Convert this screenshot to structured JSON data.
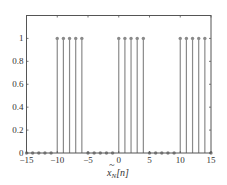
{
  "chart_data": {
    "type": "stem",
    "title": "",
    "xlabel": "x̃_N[n]",
    "xlabel_parts": {
      "base": "x",
      "tilde": "~",
      "sub": "N",
      "arg": "[n]"
    },
    "ylabel": "",
    "xlim": [
      -15,
      15
    ],
    "ylim": [
      0,
      1.2
    ],
    "xticks": [
      -15,
      -10,
      -5,
      0,
      5,
      10,
      15
    ],
    "yticks": [
      0,
      0.2,
      0.4,
      0.6,
      0.8,
      1
    ],
    "ytick_labels": [
      "0",
      "0.2",
      "0.4",
      "0.6",
      "0.8",
      "1"
    ],
    "grid": false,
    "legend": null,
    "period": 10,
    "x": [
      -15,
      -14,
      -13,
      -12,
      -11,
      -10,
      -9,
      -8,
      -7,
      -6,
      -5,
      -4,
      -3,
      -2,
      -1,
      0,
      1,
      2,
      3,
      4,
      5,
      6,
      7,
      8,
      9,
      10,
      11,
      12,
      13,
      14,
      15
    ],
    "values": [
      0,
      0,
      0,
      0,
      0,
      1,
      1,
      1,
      1,
      1,
      0,
      0,
      0,
      0,
      0,
      1,
      1,
      1,
      1,
      1,
      0,
      0,
      0,
      0,
      0,
      1,
      1,
      1,
      1,
      1,
      0
    ],
    "colors": {
      "stem": "#8a8a8a",
      "marker": "#8a8a8a",
      "axes": "#555555",
      "text": "#333333"
    }
  }
}
